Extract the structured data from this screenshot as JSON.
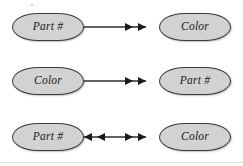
{
  "diagram": {
    "type": "functional-dependency-diagram",
    "background_color": "#ffffff",
    "box_fill_color": "#d2d2d2",
    "box_border_color": "#3a3a3a",
    "arrow_color": "#2b2b2b",
    "rows": [
      {
        "id": "row-1",
        "source_label": "Part #",
        "target_label": "Color",
        "arrow_direction": "right",
        "arrowheads": "double"
      },
      {
        "id": "row-2",
        "source_label": "Color",
        "target_label": "Part #",
        "arrow_direction": "right",
        "arrowheads": "double"
      },
      {
        "id": "row-3",
        "source_label": "Part #",
        "target_label": "Color",
        "arrow_direction": "bidirectional",
        "arrowheads": "double"
      }
    ]
  }
}
